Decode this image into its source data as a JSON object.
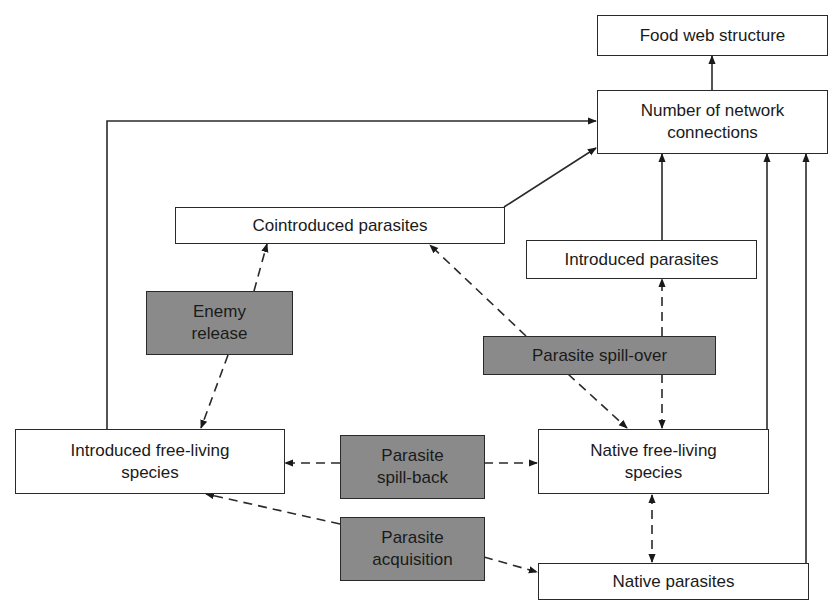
{
  "diagram": {
    "colors": {
      "box_fill": "#ffffff",
      "process_fill": "#8a8a8a",
      "stroke": "#2a2a2a"
    },
    "nodes": {
      "food_web_structure": {
        "label": "Food web structure"
      },
      "network_connections": {
        "line1": "Number of network",
        "line2": "connections"
      },
      "cointroduced_parasites": {
        "label": "Cointroduced parasites"
      },
      "introduced_parasites": {
        "label": "Introduced parasites"
      },
      "enemy_release": {
        "line1": "Enemy",
        "line2": "release"
      },
      "parasite_spill_over": {
        "label": "Parasite spill-over"
      },
      "introduced_free_living": {
        "line1": "Introduced free-living",
        "line2": "species"
      },
      "parasite_spill_back": {
        "line1": "Parasite",
        "line2": "spill-back"
      },
      "native_free_living": {
        "line1": "Native free-living",
        "line2": "species"
      },
      "parasite_acquisition": {
        "line1": "Parasite",
        "line2": "acquisition"
      },
      "native_parasites": {
        "label": "Native parasites"
      }
    },
    "edges": [
      {
        "from": "Number of network connections",
        "to": "Food web structure",
        "style": "solid"
      },
      {
        "from": "Introduced free-living species",
        "to": "Number of network connections",
        "style": "solid"
      },
      {
        "from": "Cointroduced parasites",
        "to": "Number of network connections",
        "style": "solid"
      },
      {
        "from": "Introduced parasites",
        "to": "Number of network connections",
        "style": "solid"
      },
      {
        "from": "Native free-living species",
        "to": "Number of network connections",
        "style": "solid"
      },
      {
        "from": "Native parasites",
        "to": "Number of network connections",
        "style": "solid"
      },
      {
        "from": "Enemy release",
        "to": "Cointroduced parasites",
        "style": "dashed",
        "bidirectional": true,
        "other_end": "Introduced free-living species"
      },
      {
        "from": "Parasite spill-over",
        "to": "Cointroduced parasites",
        "style": "dashed",
        "other_end": "Native free-living species"
      },
      {
        "from": "Parasite spill-over",
        "to": "Introduced parasites",
        "style": "dashed",
        "other_end": "Native free-living species"
      },
      {
        "from": "Parasite spill-back",
        "to": "Introduced free-living species",
        "style": "dashed",
        "other_end": "Native free-living species"
      },
      {
        "from": "Parasite acquisition",
        "to": "Introduced free-living species",
        "style": "dashed",
        "other_end": "Native parasites"
      },
      {
        "from": "Native free-living species",
        "to": "Native parasites",
        "style": "dashed",
        "bidirectional": true
      }
    ]
  }
}
